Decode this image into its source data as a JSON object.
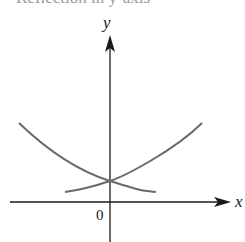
{
  "caption": "Reflection in y-axis",
  "diagram": {
    "type": "function-graph",
    "axes": {
      "x_label": "x",
      "y_label": "y",
      "origin_label": "0"
    },
    "curves": [
      {
        "name": "increasing-exponential",
        "description": "y = b^x, rising to the right"
      },
      {
        "name": "decreasing-exponential",
        "description": "y = b^(-x), reflection in the y-axis, rising to the left"
      }
    ],
    "colors": {
      "axes": "#1a1a1a",
      "curves": "#6a6a6a"
    }
  }
}
